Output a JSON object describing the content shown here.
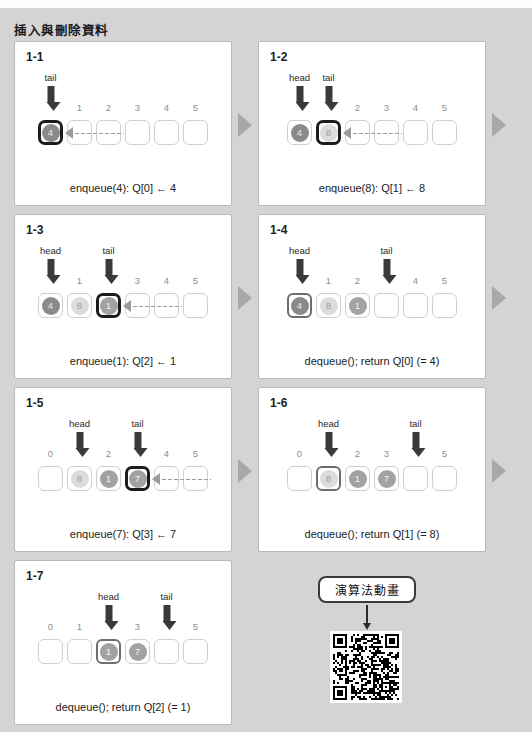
{
  "top_strip_text": "",
  "section_title": "插入與刪除資料",
  "cell_count": 6,
  "qr": {
    "label": "演算法動畫",
    "arrow_icon": "down-arrow-icon",
    "code_icon": "qr-code-icon"
  },
  "step_arrow_icon": "play-triangle-icon",
  "panels": [
    {
      "id": "1-1",
      "number": "1-1",
      "caption": "enqueue(4): Q[0] ← 4",
      "indices": [
        "",
        "1",
        "2",
        "3",
        "4",
        "5"
      ],
      "pointers": [
        "tail",
        "",
        "",
        "",
        "",
        ""
      ],
      "balls": [
        "4",
        "",
        "",
        "",
        "",
        ""
      ],
      "ball_shades": [
        "dark",
        "",
        "",
        "",
        "",
        ""
      ],
      "highlight": 0,
      "highlight_style": "hl",
      "dotted_from": 3,
      "dotted_to": 0
    },
    {
      "id": "1-2",
      "number": "1-2",
      "caption": "enqueue(8): Q[1] ← 8",
      "indices": [
        "",
        "",
        "2",
        "3",
        "4",
        "5"
      ],
      "pointers": [
        "head",
        "tail",
        "",
        "",
        "",
        ""
      ],
      "balls": [
        "4",
        "8",
        "",
        "",
        "",
        ""
      ],
      "ball_shades": [
        "dark",
        "light",
        "",
        "",
        "",
        ""
      ],
      "highlight": 1,
      "highlight_style": "hl",
      "dotted_from": 4,
      "dotted_to": 1
    },
    {
      "id": "1-3",
      "number": "1-3",
      "caption": "enqueue(1): Q[2] ← 1",
      "indices": [
        "",
        "1",
        "",
        "3",
        "4",
        "5"
      ],
      "pointers": [
        "head",
        "",
        "tail",
        "",
        "",
        ""
      ],
      "balls": [
        "4",
        "8",
        "1",
        "",
        "",
        ""
      ],
      "ball_shades": [
        "dark",
        "light",
        "mid",
        "",
        "",
        ""
      ],
      "highlight": 2,
      "highlight_style": "hl",
      "dotted_from": 5,
      "dotted_to": 2
    },
    {
      "id": "1-4",
      "number": "1-4",
      "caption": "dequeue(); return Q[0] (= 4)",
      "indices": [
        "",
        "1",
        "2",
        "",
        "4",
        "5"
      ],
      "pointers": [
        "head",
        "",
        "",
        "tail",
        "",
        ""
      ],
      "balls": [
        "4",
        "8",
        "1",
        "",
        "",
        ""
      ],
      "ball_shades": [
        "dark",
        "light",
        "mid",
        "",
        "",
        ""
      ],
      "highlight": 0,
      "highlight_style": "ring",
      "dotted_from": -1,
      "dotted_to": -1
    },
    {
      "id": "1-5",
      "number": "1-5",
      "caption": "enqueue(7): Q[3] ← 7",
      "indices": [
        "0",
        "",
        "2",
        "",
        "4",
        "5"
      ],
      "pointers": [
        "",
        "head",
        "",
        "tail",
        "",
        ""
      ],
      "balls": [
        "",
        "8",
        "1",
        "7",
        "",
        ""
      ],
      "ball_shades": [
        "",
        "light",
        "mid",
        "mid",
        "",
        ""
      ],
      "highlight": 3,
      "highlight_style": "hl",
      "dotted_from": 6,
      "dotted_to": 3
    },
    {
      "id": "1-6",
      "number": "1-6",
      "caption": "dequeue(); return Q[1] (= 8)",
      "indices": [
        "0",
        "",
        "2",
        "3",
        "",
        "5"
      ],
      "pointers": [
        "",
        "head",
        "",
        "",
        "tail",
        ""
      ],
      "balls": [
        "",
        "8",
        "1",
        "7",
        "",
        ""
      ],
      "ball_shades": [
        "",
        "light",
        "mid",
        "mid",
        "",
        ""
      ],
      "highlight": 1,
      "highlight_style": "ring",
      "dotted_from": -1,
      "dotted_to": -1
    },
    {
      "id": "1-7",
      "number": "1-7",
      "caption": "dequeue(); return Q[2] (= 1)",
      "indices": [
        "0",
        "1",
        "",
        "3",
        "",
        "5"
      ],
      "pointers": [
        "",
        "",
        "head",
        "",
        "tail",
        ""
      ],
      "balls": [
        "",
        "",
        "1",
        "7",
        "",
        ""
      ],
      "ball_shades": [
        "",
        "",
        "mid",
        "mid",
        "",
        ""
      ],
      "highlight": 2,
      "highlight_style": "ring",
      "dotted_from": -1,
      "dotted_to": -1
    }
  ]
}
